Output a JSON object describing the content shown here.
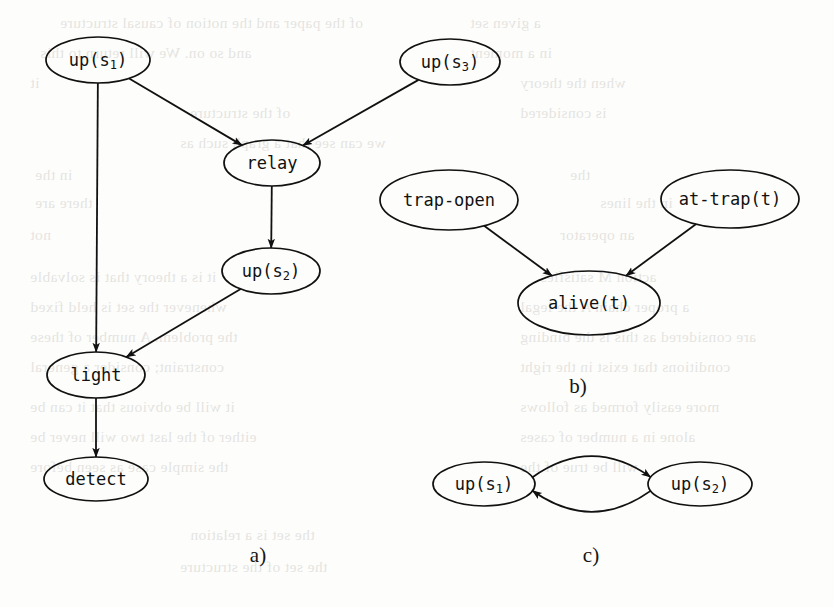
{
  "figure": {
    "width": 834,
    "height": 607,
    "background_color": "#fdfdfb",
    "ink_color": "#111111"
  },
  "panels": [
    {
      "id": "a",
      "caption": "a)",
      "caption_x": 258,
      "caption_y": 562,
      "nodes": [
        {
          "id": "a-up-s1",
          "text": "up(s",
          "sub": "1",
          "tail": ")",
          "cx": 98,
          "cy": 60,
          "rx": 52,
          "ry": 23
        },
        {
          "id": "a-up-s3",
          "text": "up(s",
          "sub": "3",
          "tail": ")",
          "cx": 450,
          "cy": 62,
          "rx": 50,
          "ry": 23
        },
        {
          "id": "a-relay",
          "text": "relay",
          "sub": "",
          "tail": "",
          "cx": 272,
          "cy": 163,
          "rx": 48,
          "ry": 23
        },
        {
          "id": "a-up-s2",
          "text": "up(s",
          "sub": "2",
          "tail": ")",
          "cx": 271,
          "cy": 271,
          "rx": 49,
          "ry": 23
        },
        {
          "id": "a-light",
          "text": "light",
          "sub": "",
          "tail": "",
          "cx": 96,
          "cy": 375,
          "rx": 49,
          "ry": 23
        },
        {
          "id": "a-detect",
          "text": "detect",
          "sub": "",
          "tail": "",
          "cx": 96,
          "cy": 479,
          "rx": 52,
          "ry": 22
        }
      ],
      "edges": [
        {
          "id": "a-e1",
          "from": "a-up-s1",
          "to": "a-relay",
          "kind": "straight"
        },
        {
          "id": "a-e2",
          "from": "a-up-s3",
          "to": "a-relay",
          "kind": "straight"
        },
        {
          "id": "a-e3",
          "from": "a-relay",
          "to": "a-up-s2",
          "kind": "straight"
        },
        {
          "id": "a-e4",
          "from": "a-up-s2",
          "to": "a-light",
          "kind": "straight"
        },
        {
          "id": "a-e5",
          "from": "a-up-s1",
          "to": "a-light",
          "kind": "straight"
        },
        {
          "id": "a-e6",
          "from": "a-light",
          "to": "a-detect",
          "kind": "straight"
        }
      ]
    },
    {
      "id": "b",
      "caption": "b)",
      "caption_x": 578,
      "caption_y": 393,
      "nodes": [
        {
          "id": "b-trap-open",
          "text": "trap-open",
          "sub": "",
          "tail": "",
          "cx": 449,
          "cy": 200,
          "rx": 69,
          "ry": 30
        },
        {
          "id": "b-at-trap",
          "text": "at-trap(t)",
          "sub": "",
          "tail": "",
          "cx": 730,
          "cy": 199,
          "rx": 69,
          "ry": 29
        },
        {
          "id": "b-alive",
          "text": "alive(t)",
          "sub": "",
          "tail": "",
          "cx": 589,
          "cy": 303,
          "rx": 71,
          "ry": 32
        }
      ],
      "edges": [
        {
          "id": "b-e1",
          "from": "b-trap-open",
          "to": "b-alive",
          "kind": "straight"
        },
        {
          "id": "b-e2",
          "from": "b-at-trap",
          "to": "b-alive",
          "kind": "straight"
        }
      ]
    },
    {
      "id": "c",
      "caption": "c)",
      "caption_x": 591,
      "caption_y": 562,
      "nodes": [
        {
          "id": "c-up-s1",
          "text": "up(s",
          "sub": "1",
          "tail": ")",
          "cx": 484,
          "cy": 484,
          "rx": 51,
          "ry": 22
        },
        {
          "id": "c-up-s2",
          "text": "up(s",
          "sub": "2",
          "tail": ")",
          "cx": 700,
          "cy": 484,
          "rx": 52,
          "ry": 22
        }
      ],
      "edges": [
        {
          "id": "c-e1",
          "from": "c-up-s1",
          "to": "c-up-s2",
          "kind": "curve-top"
        },
        {
          "id": "c-e2",
          "from": "c-up-s2",
          "to": "c-up-s1",
          "kind": "curve-bottom"
        }
      ]
    }
  ],
  "background_text": {
    "note": "faint bleed-through text from the reverse side of the scanned page",
    "lines": [
      {
        "x": 60,
        "y": 8,
        "text": "of the paper and the notion of causal structure"
      },
      {
        "x": 470,
        "y": 8,
        "text": "a given set"
      },
      {
        "x": 40,
        "y": 38,
        "text": "and so on. We will return to this"
      },
      {
        "x": 470,
        "y": 38,
        "text": "in a moment"
      },
      {
        "x": 30,
        "y": 68,
        "text": "it"
      },
      {
        "x": 520,
        "y": 68,
        "text": "when the theory"
      },
      {
        "x": 190,
        "y": 98,
        "text": "of the structure"
      },
      {
        "x": 520,
        "y": 98,
        "text": "is considered"
      },
      {
        "x": 180,
        "y": 128,
        "text": "we can see that a graph such as"
      },
      {
        "x": 35,
        "y": 160,
        "text": "in the"
      },
      {
        "x": 570,
        "y": 160,
        "text": "the"
      },
      {
        "x": 35,
        "y": 188,
        "text": "there are"
      },
      {
        "x": 600,
        "y": 188,
        "text": "in the lines"
      },
      {
        "x": 30,
        "y": 220,
        "text": "not"
      },
      {
        "x": 560,
        "y": 220,
        "text": "an operator"
      },
      {
        "x": 30,
        "y": 262,
        "text": "it is a theory that is solvable"
      },
      {
        "x": 540,
        "y": 262,
        "text": "action M satisfies"
      },
      {
        "x": 30,
        "y": 292,
        "text": "whenever the set is held fixed"
      },
      {
        "x": 520,
        "y": 292,
        "text": "a proper chain A the legal"
      },
      {
        "x": 30,
        "y": 322,
        "text": "the problem. A number of these"
      },
      {
        "x": 520,
        "y": 322,
        "text": "are considered as this is the binding"
      },
      {
        "x": 30,
        "y": 352,
        "text": "constraint; consider a general"
      },
      {
        "x": 520,
        "y": 352,
        "text": "conditions that exist in the right"
      },
      {
        "x": 30,
        "y": 392,
        "text": "it will be obvious that it can be"
      },
      {
        "x": 520,
        "y": 392,
        "text": "more easily formed as follows"
      },
      {
        "x": 30,
        "y": 422,
        "text": "either of the last two will never be"
      },
      {
        "x": 520,
        "y": 422,
        "text": "alone in a number of cases"
      },
      {
        "x": 30,
        "y": 452,
        "text": "the simple case as seen before"
      },
      {
        "x": 520,
        "y": 452,
        "text": "will be true of the"
      },
      {
        "x": 190,
        "y": 520,
        "text": "the set is a relation"
      },
      {
        "x": 180,
        "y": 552,
        "text": "the set of the structure"
      }
    ]
  }
}
